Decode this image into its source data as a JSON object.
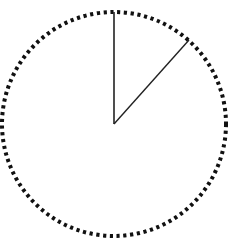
{
  "diagram": {
    "type": "circle-sector",
    "circle": {
      "cx": 114,
      "cy": 124,
      "r": 112,
      "stroke_style": "dotted",
      "stroke_color": "#111111"
    },
    "radii": [
      {
        "name": "vertical-radius",
        "x2": 114,
        "y2": 12
      },
      {
        "name": "angled-radius",
        "x2": 189,
        "y2": 40
      }
    ],
    "sector_angle_deg": 41,
    "line_color": "#222222",
    "background": "#ffffff"
  }
}
